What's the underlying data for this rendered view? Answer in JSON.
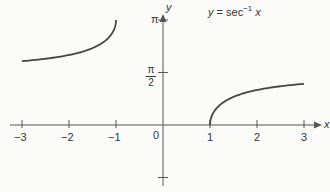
{
  "chart_data": {
    "type": "line",
    "title_parts": {
      "lhs": "y",
      "eq": " = sec",
      "sup": "−1",
      "var": " x"
    },
    "xlabel": "x",
    "ylabel": "y",
    "xlim": [
      -3.3,
      3.4
    ],
    "ylim": [
      -1.6,
      3.4
    ],
    "grid": false,
    "legend": "none",
    "x_ticks": [
      -3,
      -2,
      -1,
      0,
      1,
      2,
      3
    ],
    "x_tick_labels": [
      "−3",
      "−2",
      "−1",
      "0",
      "1",
      "2",
      "3"
    ],
    "y_ticks": [
      3.14159,
      1.5708,
      -1.5708
    ],
    "y_tick_labels": [
      "π",
      "π/2",
      ""
    ],
    "series": [
      {
        "name": "sec^-1 x (x <= -1)",
        "x": [
          -3,
          -2.5,
          -2,
          -1.5,
          -1.2,
          -1.05,
          -1
        ],
        "y": [
          1.911,
          1.982,
          2.094,
          2.301,
          2.556,
          2.831,
          3.1416
        ]
      },
      {
        "name": "sec^-1 x (x >= 1)",
        "x": [
          1,
          1.05,
          1.2,
          1.5,
          2,
          2.5,
          3
        ],
        "y": [
          0,
          0.311,
          0.586,
          0.841,
          1.047,
          1.159,
          1.231
        ]
      }
    ]
  },
  "labels": {
    "origin": "0",
    "pi": "π",
    "half_num": "π",
    "half_den": "2",
    "x_axis": "x",
    "y_axis": "y"
  }
}
